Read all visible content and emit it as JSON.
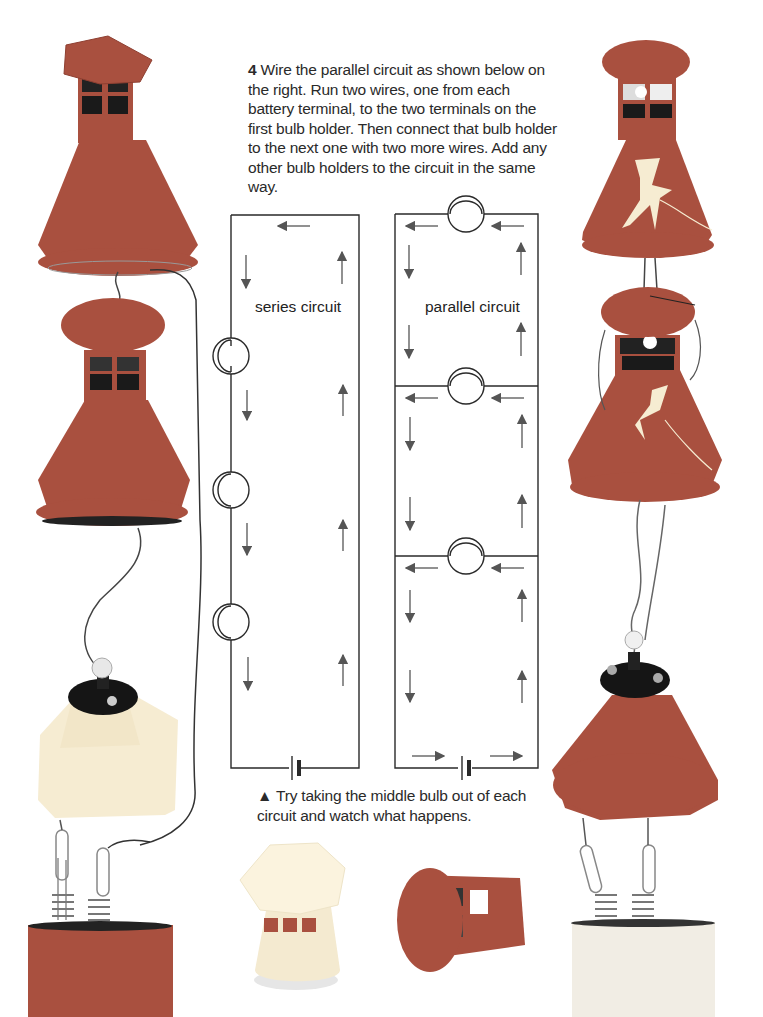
{
  "instructions": {
    "step_number": "4",
    "text": "Wire the parallel circuit as shown below on the right. Run two wires, one from each battery terminal, to the two terminals on the first bulb holder. Then connect that bulb holder to the next one with two more wires. Add any other bulb holders to the circuit in the same way."
  },
  "diagrams": {
    "series": {
      "label": "series circuit",
      "bulb_count": 3,
      "components": [
        "bulb",
        "bulb",
        "bulb",
        "battery"
      ]
    },
    "parallel": {
      "label": "parallel circuit",
      "bulb_count": 3,
      "components": [
        "bulb",
        "bulb",
        "bulb",
        "battery"
      ]
    }
  },
  "caption": {
    "marker": "▲",
    "text": "Try taking the middle bulb out of each circuit and watch what happens."
  },
  "colors": {
    "shade": "#a9503f",
    "shade_dark": "#8e3f31",
    "shade_light": "#f6ecd2",
    "battery_pale": "#f1ede4",
    "wire": "#333333",
    "diagram_line": "#2a2a2a",
    "arrow": "#555555"
  }
}
